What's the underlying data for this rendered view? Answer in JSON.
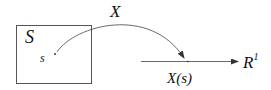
{
  "diagram": {
    "set_label": "S",
    "point_label": "s",
    "map_label": "X",
    "image_label": "X(s)",
    "codomain_label": "R",
    "codomain_superscript": "1",
    "stroke_color": "#333333"
  }
}
